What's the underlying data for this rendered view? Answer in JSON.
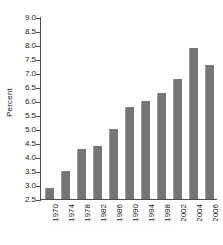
{
  "chart_data": {
    "type": "bar",
    "title": "",
    "xlabel": "",
    "ylabel": "Percent",
    "categories": [
      "1970",
      "1974",
      "1978",
      "1982",
      "1986",
      "1990",
      "1994",
      "1998",
      "2002",
      "2004",
      "2006"
    ],
    "values": [
      2.9,
      3.5,
      4.3,
      4.4,
      5.0,
      5.8,
      6.0,
      6.3,
      6.8,
      7.9,
      7.3
    ],
    "ylim": [
      2.5,
      9.0
    ],
    "yticks": [
      "2.5",
      "3.0",
      "3.5",
      "4.0",
      "4.5",
      "5.0",
      "5.5",
      "6.0",
      "6.5",
      "7.0",
      "7.5",
      "8.0",
      "8.5",
      "9.0"
    ],
    "ytick_values": [
      2.5,
      3.0,
      3.5,
      4.0,
      4.5,
      5.0,
      5.5,
      6.0,
      6.5,
      7.0,
      7.5,
      8.0,
      8.5,
      9.0
    ],
    "grid": false,
    "legend": false,
    "bar_color": "#767676",
    "axis_color": "#4d4d4d",
    "background": "#ffffff"
  }
}
